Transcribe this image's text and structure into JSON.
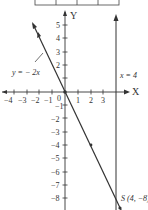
{
  "diagram": {
    "axes": {
      "x_label": "X",
      "y_label": "Y",
      "origin_label": "0",
      "x_ticks": [
        "−4",
        "−3",
        "−2",
        "−1",
        "1",
        "2",
        "3"
      ],
      "y_ticks_pos": [
        "5",
        "4",
        "3",
        "2",
        "1"
      ],
      "y_ticks_neg": [
        "−1",
        "−2",
        "−3",
        "−4",
        "−5",
        "−6",
        "−7",
        "−8"
      ]
    },
    "lines": {
      "line1_label": "y = − 2x",
      "line2_label": "x = 4"
    },
    "point": {
      "label": "S (4, −8)"
    },
    "colors": {
      "stroke": "#333333",
      "background": "#ffffff"
    }
  }
}
